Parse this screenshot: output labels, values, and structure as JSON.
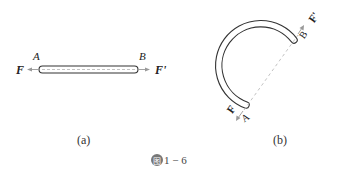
{
  "figure": {
    "number_icon_glyph": "图",
    "number_text": "1 − 6"
  },
  "panel_a": {
    "caption": "(a)",
    "point_left": "A",
    "point_right": "B",
    "force_left": "F",
    "force_right": "F'"
  },
  "panel_b": {
    "caption": "(b)",
    "point_start": "A",
    "point_end": "B",
    "force_start": "F",
    "force_end": "F'"
  },
  "colors": {
    "stroke": "#333333",
    "dashed": "#bbbbbb",
    "arrow": "#999999"
  }
}
